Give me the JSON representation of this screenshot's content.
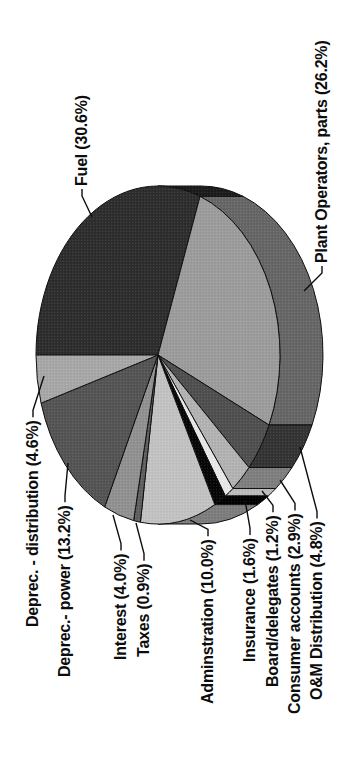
{
  "figure": {
    "background": "#ffffff",
    "text_color": "#0d0d0d",
    "outline_color": "#0d0d0d",
    "orientation_note": "landscape chart rotated 90 degrees counter-clockwise"
  },
  "chart_data": {
    "type": "pie",
    "style": "3d-pie-scanned-grayscale",
    "title": "",
    "unit": "%",
    "start_angle_deg": 0,
    "clockwise": true,
    "rotation_deg": -90,
    "geometry": {
      "cx": 429,
      "cy": 158,
      "rx": 169,
      "ry": 122,
      "depth": 43,
      "canvas_w": 784,
      "canvas_h": 352
    },
    "slices": [
      {
        "name": "Fuel",
        "value": 30.6,
        "display": "Fuel (30.6%)",
        "color": "#2d2d2d",
        "rim": "#1b1b1b",
        "label_x": 598,
        "label_y": 87,
        "attach": "start",
        "leader_end": [
          567,
          92
        ]
      },
      {
        "name": "Plant Operators, parts",
        "value": 26.2,
        "display": "Plant Operators, parts (26.2%)",
        "color": "#9c9c9c",
        "rim": "#666666",
        "label_x": 521,
        "label_y": 327,
        "attach": "start",
        "leader_end": [
          493,
          304
        ]
      },
      {
        "name": "O&M Distribution",
        "value": 4.8,
        "display": "O&M Distribution (4.8%)",
        "color": "#4f4f4f",
        "rim": "#333333",
        "label_x": 84,
        "label_y": 322,
        "attach": "end",
        "leader_end": [
          337,
          300
        ]
      },
      {
        "name": "Consumer accounts",
        "value": 2.9,
        "display": "Consumer accounts (2.9%)",
        "color": "#b3b3b3",
        "rim": "#7f7f7f",
        "label_x": 70,
        "label_y": 300,
        "attach": "end",
        "leader_end": [
          304,
          280
        ]
      },
      {
        "name": "Board/delegates",
        "value": 1.2,
        "display": "Board/delegates (1.2%)",
        "color": "#e9e9e9",
        "rim": "#bdbdbd",
        "label_x": 97,
        "label_y": 278,
        "attach": "end",
        "leader_end": [
          293,
          262
        ]
      },
      {
        "name": "Insurance",
        "value": 1.6,
        "display": "Insurance (1.6%)",
        "color": "#060606",
        "rim": "#000000",
        "label_x": 122,
        "label_y": 255,
        "attach": "end",
        "leader_end": [
          284,
          245
        ]
      },
      {
        "name": "Adminstration",
        "value": 10.0,
        "display": "Adminstration (10.0%)",
        "color": "#c3c3c3",
        "rim": "#7d7d7d",
        "label_x": 80,
        "label_y": 213,
        "attach": "end",
        "leader_end": [
          264,
          190
        ]
      },
      {
        "name": "Taxes",
        "value": 0.9,
        "display": "Taxes (0.9%)",
        "color": "#5f5f5f",
        "rim": "#3f3f3f",
        "label_x": 127,
        "label_y": 149,
        "attach": "end",
        "leader_end": [
          261,
          136
        ]
      },
      {
        "name": "Interest",
        "value": 4.0,
        "display": "Interest (4.0%)",
        "color": "#919191",
        "rim": "#616161",
        "label_x": 124,
        "label_y": 126,
        "attach": "end",
        "leader_end": [
          269,
          113
        ]
      },
      {
        "name": "Deprec.- power",
        "value": 13.2,
        "display": "Deprec.- power (13.2%)",
        "color": "#545454",
        "rim": "#383838",
        "label_x": 107,
        "label_y": 70,
        "attach": "end",
        "leader_end": [
          321,
          68
        ]
      },
      {
        "name": "Deprec. - distribution",
        "value": 4.6,
        "display": "Deprec. - distribution (4.6%)",
        "color": "#a8a8a8",
        "rim": "#707070",
        "label_x": 157,
        "label_y": 38,
        "attach": "end",
        "leader_end": [
          408,
          44
        ]
      }
    ]
  }
}
